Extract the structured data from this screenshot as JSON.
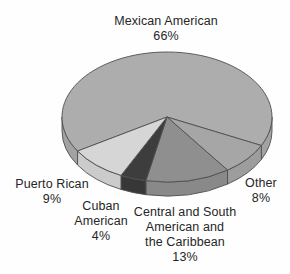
{
  "background_color": "#fefefe",
  "text_color": "#262626",
  "chart_data": {
    "type": "pie",
    "style": "3d",
    "unit": "%",
    "title": "",
    "legend": "none",
    "labels_position": "around",
    "outline_color": "#4f4f4f",
    "slices": [
      {
        "label": "Mexican American",
        "pct": 66,
        "display": "Mexican American\n66%",
        "color": "#adadad",
        "side_color": "#a2a2a2"
      },
      {
        "label": "Other",
        "pct": 8,
        "display": "Other\n8%",
        "color": "#a6a6a6",
        "side_color": "#9d9d9d"
      },
      {
        "label": "Central and South American and the Caribbean",
        "pct": 13,
        "display": "Central and South\nAmerican and\nthe Caribbean\n13%",
        "color": "#8f8f8f",
        "side_color": "#898989"
      },
      {
        "label": "Cuban American",
        "pct": 4,
        "display": "Cuban\nAmerican\n4%",
        "color": "#3d3d3d",
        "side_color": "#373737"
      },
      {
        "label": "Puerto Rican",
        "pct": 9,
        "display": "Puerto Rican\n9%",
        "color": "#d6d6d6",
        "side_color": "#cbcbcb"
      }
    ],
    "geometry": {
      "cx": 167,
      "cy": 117,
      "rx": 105,
      "ry": 65,
      "depth": 14,
      "start_angle": 148.4,
      "direction": "clockwise"
    }
  }
}
